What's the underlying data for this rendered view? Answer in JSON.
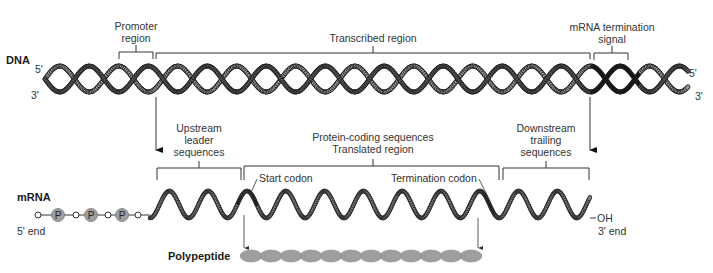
{
  "dna": {
    "label": "DNA",
    "five_prime_left": "5'",
    "three_prime_left": "3'",
    "five_prime_right": "5'",
    "three_prime_right": "3'",
    "promoter_region": [
      "Promoter",
      "region"
    ],
    "transcribed_region": "Transcribed region",
    "termination_signal": [
      "mRNA termination",
      "signal"
    ]
  },
  "mrna": {
    "label": "mRNA",
    "five_end": "5' end",
    "three_end": "3' end",
    "oh": "OH",
    "phosphate": "P",
    "upstream": [
      "Upstream",
      "leader",
      "sequences"
    ],
    "coding": [
      "Protein-coding sequences",
      "Translated region"
    ],
    "downstream": [
      "Downstream",
      "trailing",
      "sequences"
    ],
    "start_codon": "Start codon",
    "termination_codon": "Termination codon"
  },
  "polypeptide": {
    "label": "Polypeptide",
    "residue_count": 12
  },
  "colors": {
    "strand_dark": "#555555",
    "strand_light": "#9a9a9a",
    "highlight": "#111111",
    "bead": "#9e9e9e",
    "line": "#333333"
  }
}
